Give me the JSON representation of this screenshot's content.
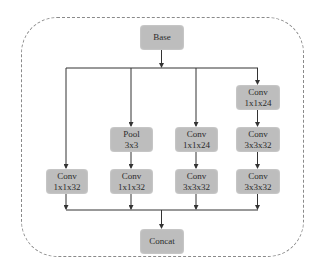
{
  "diagram": {
    "colors": {
      "node_fill": "#bdbdbd",
      "line": "#333333",
      "frame": "#8a8a8a"
    },
    "input": {
      "label": "Base"
    },
    "output": {
      "label": "Concat"
    },
    "branches": [
      {
        "nodes": [
          {
            "line1": "Conv",
            "line2": "1x1x32"
          }
        ]
      },
      {
        "nodes": [
          {
            "line1": "Pool",
            "line2": "3x3"
          },
          {
            "line1": "Conv",
            "line2": "1x1x32"
          }
        ]
      },
      {
        "nodes": [
          {
            "line1": "Conv",
            "line2": "1x1x24"
          },
          {
            "line1": "Conv",
            "line2": "3x3x32"
          }
        ]
      },
      {
        "nodes": [
          {
            "line1": "Conv",
            "line2": "1x1x24"
          },
          {
            "line1": "Conv",
            "line2": "3x3x32"
          },
          {
            "line1": "Conv",
            "line2": "3x3x32"
          }
        ]
      }
    ]
  }
}
